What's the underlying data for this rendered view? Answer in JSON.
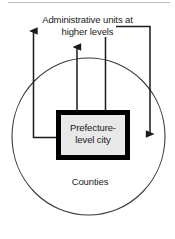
{
  "diagram": {
    "title": "Administrative units at\nhigher levels",
    "center_box": {
      "label": "Prefecture-\nlevel city",
      "fill_color": "#e8e8e8",
      "border_color": "#000000"
    },
    "outer_region": {
      "label": "Counties",
      "shape": "circle",
      "stroke_color": "#3a3a3a"
    },
    "arrows": [
      {
        "name": "counties-to-higher-levels",
        "direction": "up",
        "from": "Counties",
        "to": "Administrative units at higher levels"
      },
      {
        "name": "prefecture-city-to-higher-levels",
        "direction": "up",
        "from": "Prefecture-level city",
        "to": "Administrative units at higher levels"
      },
      {
        "name": "higher-levels-to-prefecture-city",
        "direction": "down",
        "from": "Administrative units at higher levels",
        "to": "Prefecture-level city"
      },
      {
        "name": "higher-levels-to-counties",
        "direction": "down",
        "from": "Administrative units at higher levels",
        "to": "Counties"
      }
    ]
  }
}
